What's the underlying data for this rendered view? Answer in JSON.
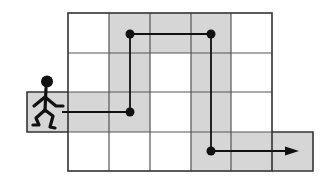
{
  "diagram": {
    "colors": {
      "background": "#ffffff",
      "shaded_cell": "#d6d6d6",
      "grid_line": "#3a3a3a",
      "grid_line_light": "#6a6a6a",
      "path": "#111111",
      "figure": "#111111"
    },
    "grid": {
      "columns": 5,
      "rows": 4,
      "left_extension": {
        "row": 3,
        "label": "start cell"
      },
      "right_extension": {
        "row": 4,
        "label": "end cell"
      }
    },
    "shaded_cells": [
      {
        "row": 1,
        "col": 2
      },
      {
        "row": 1,
        "col": 3
      },
      {
        "row": 1,
        "col": 4
      },
      {
        "row": 2,
        "col": 2
      },
      {
        "row": 2,
        "col": 4
      },
      {
        "row": 3,
        "col": 0
      },
      {
        "row": 3,
        "col": 1
      },
      {
        "row": 3,
        "col": 2
      },
      {
        "row": 3,
        "col": 4
      },
      {
        "row": 4,
        "col": 4
      },
      {
        "row": 4,
        "col": 5
      },
      {
        "row": 4,
        "col": 6
      }
    ],
    "path_points": [
      {
        "label": "start",
        "row": 3,
        "col": 1
      },
      {
        "label": "turn-1",
        "row": 3,
        "col": 2
      },
      {
        "label": "turn-2",
        "row": 1,
        "col": 2
      },
      {
        "label": "turn-3",
        "row": 1,
        "col": 4
      },
      {
        "label": "turn-4",
        "row": 4,
        "col": 4
      },
      {
        "label": "end-arrow",
        "row": 4,
        "col": 6
      }
    ],
    "figure": {
      "icon": "walking-stick-figure-icon"
    },
    "arrow": {
      "icon": "arrowhead-right-icon"
    }
  }
}
